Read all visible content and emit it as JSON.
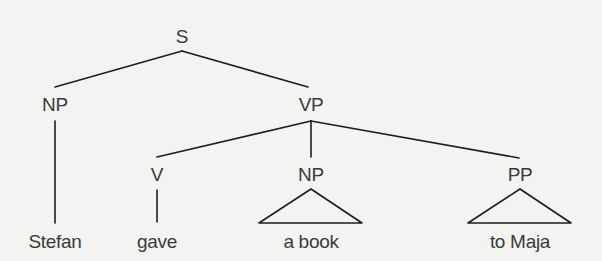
{
  "diagram": {
    "type": "syntax-tree",
    "root": "S",
    "nodes": {
      "s": {
        "label": "S",
        "category": "sentence"
      },
      "np_subject": {
        "label": "NP",
        "category": "noun-phrase",
        "parent": "s"
      },
      "vp": {
        "label": "VP",
        "category": "verb-phrase",
        "parent": "s"
      },
      "v": {
        "label": "V",
        "category": "verb",
        "parent": "vp"
      },
      "np_object": {
        "label": "NP",
        "category": "noun-phrase",
        "parent": "vp",
        "collapsed": true
      },
      "pp": {
        "label": "PP",
        "category": "prepositional-phrase",
        "parent": "vp",
        "collapsed": true
      }
    },
    "leaves": {
      "stefan": {
        "text": "Stefan",
        "parent": "np_subject"
      },
      "gave": {
        "text": "gave",
        "parent": "v"
      },
      "a_book": {
        "text": "a book",
        "parent": "np_object"
      },
      "to_maja": {
        "text": "to Maja",
        "parent": "pp"
      }
    },
    "sentence": "Stefan gave a book to Maja"
  }
}
